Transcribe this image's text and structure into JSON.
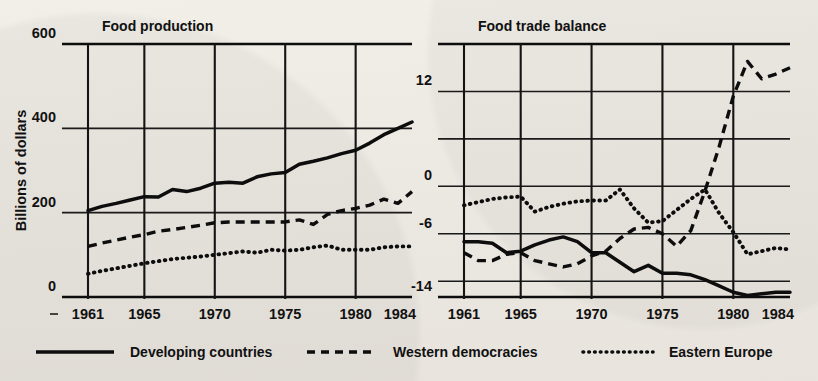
{
  "figure": {
    "background_color": "#eeeae4",
    "ink_color": "#111111",
    "y_axis_title_left": "Billions of dollars"
  },
  "legend": {
    "position": "bottom",
    "items": [
      {
        "label": "Developing countries",
        "style": "solid"
      },
      {
        "label": "Western democracies",
        "style": "dashed"
      },
      {
        "label": "Eastern Europe",
        "style": "dotted"
      }
    ]
  },
  "chart_data": [
    {
      "type": "line",
      "title": "Food production",
      "xlabel": "",
      "ylabel": "Billions of dollars",
      "xlim": [
        1961,
        1984
      ],
      "ylim": [
        0,
        600
      ],
      "xticks": [
        "1961",
        "1965",
        "1970",
        "1975",
        "1980",
        "1984"
      ],
      "xtick_values": [
        1961,
        1965,
        1970,
        1975,
        1980,
        1984
      ],
      "yticks": [
        "0",
        "200",
        "400",
        "600"
      ],
      "ytick_values": [
        0,
        200,
        400,
        600
      ],
      "grid": "both",
      "x": [
        1961,
        1962,
        1963,
        1964,
        1965,
        1966,
        1967,
        1968,
        1969,
        1970,
        1971,
        1972,
        1973,
        1974,
        1975,
        1976,
        1977,
        1978,
        1979,
        1980,
        1981,
        1982,
        1983,
        1984
      ],
      "series": [
        {
          "name": "Developing countries",
          "style": "solid",
          "values": [
            205,
            215,
            222,
            230,
            238,
            237,
            255,
            250,
            258,
            270,
            272,
            270,
            285,
            292,
            295,
            315,
            322,
            330,
            340,
            348,
            365,
            385,
            400,
            415
          ]
        },
        {
          "name": "Western democracies",
          "style": "dashed",
          "values": [
            120,
            128,
            135,
            142,
            148,
            156,
            160,
            165,
            170,
            176,
            178,
            178,
            178,
            178,
            178,
            183,
            172,
            196,
            205,
            210,
            218,
            232,
            222,
            250
          ]
        },
        {
          "name": "Eastern Europe",
          "style": "dotted",
          "values": [
            55,
            62,
            68,
            74,
            80,
            85,
            90,
            93,
            96,
            100,
            104,
            108,
            105,
            112,
            110,
            112,
            118,
            122,
            112,
            112,
            112,
            118,
            120,
            120
          ]
        }
      ]
    },
    {
      "type": "line",
      "title": "Food trade balance",
      "xlabel": "",
      "ylabel": "",
      "xlim": [
        1961,
        1984
      ],
      "ylim": [
        -14,
        18
      ],
      "xticks": [
        "1961",
        "1965",
        "1970",
        "1975",
        "1980",
        "1984"
      ],
      "xtick_values": [
        1961,
        1965,
        1970,
        1975,
        1980,
        1984
      ],
      "yticks": [
        "12",
        "0",
        "-6",
        "-14"
      ],
      "ytick_values": [
        12,
        0,
        -6,
        -14
      ],
      "grid": "both",
      "x": [
        1961,
        1962,
        1963,
        1964,
        1965,
        1966,
        1967,
        1968,
        1969,
        1970,
        1971,
        1972,
        1973,
        1974,
        1975,
        1976,
        1977,
        1978,
        1979,
        1980,
        1981,
        1982,
        1983,
        1984
      ],
      "series": [
        {
          "name": "Developing countries",
          "style": "solid",
          "values": [
            -7.0,
            -7.0,
            -7.2,
            -8.4,
            -8.2,
            -7.4,
            -6.8,
            -6.4,
            -7.0,
            -8.4,
            -8.4,
            -9.6,
            -10.8,
            -10.0,
            -11.0,
            -11.0,
            -11.2,
            -11.8,
            -12.6,
            -13.4,
            -13.8,
            -13.6,
            -13.4,
            -13.4
          ]
        },
        {
          "name": "Western democracies",
          "style": "dashed",
          "values": [
            -8.4,
            -9.4,
            -9.4,
            -8.6,
            -8.4,
            -9.4,
            -9.8,
            -10.2,
            -9.8,
            -8.8,
            -8.2,
            -6.6,
            -5.4,
            -5.2,
            -6.0,
            -7.6,
            -5.6,
            -0.6,
            5.0,
            11.4,
            15.8,
            13.6,
            14.2,
            15.0
          ]
        },
        {
          "name": "Eastern Europe",
          "style": "dotted",
          "values": [
            -2.4,
            -2.0,
            -1.6,
            -1.4,
            -1.3,
            -3.2,
            -2.6,
            -2.2,
            -1.9,
            -1.8,
            -1.8,
            -0.4,
            -2.8,
            -4.6,
            -4.4,
            -3.0,
            -1.6,
            -0.4,
            -3.4,
            -5.8,
            -8.6,
            -8.2,
            -7.8,
            -8.0
          ]
        }
      ]
    }
  ]
}
